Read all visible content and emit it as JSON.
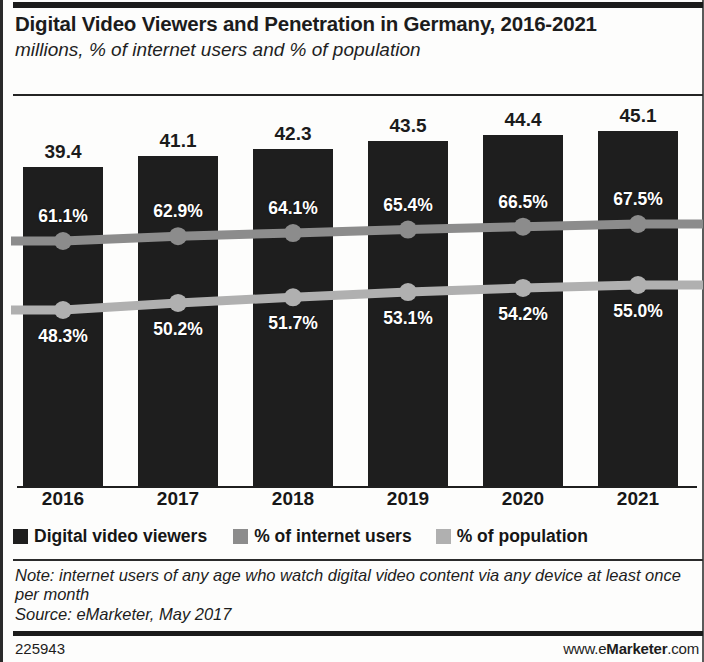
{
  "header": {
    "title": "Digital Video Viewers and Penetration in Germany, 2016-2021",
    "subtitle": "millions, % of internet users and % of population"
  },
  "footer": {
    "note": "Note: internet users of any age who watch digital video content via any device at least once per month",
    "source": "Source: eMarketer, May 2017",
    "id": "225943",
    "url_prefix": "www.e",
    "url_brand": "Marketer",
    "url_suffix": ".com"
  },
  "colors": {
    "bar": "#1e1e1e",
    "internet_users_line": "#8c8c8c",
    "population_line": "#b0b0b0",
    "text": "#171717",
    "label_on_bar": "#ffffff"
  },
  "chart_data": {
    "type": "bar",
    "title": "Digital Video Viewers and Penetration in Germany, 2016-2021",
    "subtitle": "millions, % of internet users and % of population",
    "xlabel": "",
    "ylabel": "",
    "grid": false,
    "legend_position": "bottom",
    "categories": [
      "2016",
      "2017",
      "2018",
      "2019",
      "2020",
      "2021"
    ],
    "ylim": [
      0,
      50
    ],
    "series": [
      {
        "name": "Digital video viewers",
        "type": "bar",
        "unit": "millions",
        "values": [
          39.4,
          41.1,
          42.3,
          43.5,
          44.4,
          45.1
        ],
        "labels": [
          "39.4",
          "41.1",
          "42.3",
          "43.5",
          "44.4",
          "45.1"
        ]
      },
      {
        "name": "% of internet users",
        "type": "line",
        "unit": "percent",
        "values": [
          61.1,
          62.9,
          64.1,
          65.4,
          66.5,
          67.5
        ],
        "labels": [
          "61.1%",
          "62.9%",
          "64.1%",
          "65.4%",
          "66.5%",
          "67.5%"
        ]
      },
      {
        "name": "% of population",
        "type": "line",
        "unit": "percent",
        "values": [
          48.3,
          50.2,
          51.7,
          53.1,
          54.2,
          55.0
        ],
        "labels": [
          "48.3%",
          "50.2%",
          "51.7%",
          "53.1%",
          "54.2%",
          "55.0%"
        ]
      }
    ]
  }
}
